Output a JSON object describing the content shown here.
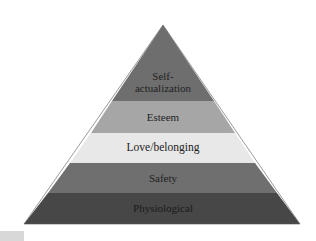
{
  "diagram": {
    "type": "pyramid",
    "title": "",
    "levels": [
      {
        "label_line1": "Self-",
        "label_line2": "actualization",
        "color": "#6e6e6e"
      },
      {
        "label": "Esteem",
        "color": "#a6a6a6"
      },
      {
        "label": "Love/belonging",
        "color": "#e8e8e8"
      },
      {
        "label": "Safety",
        "color": "#6f6f6f"
      },
      {
        "label": "Physiological",
        "color": "#474747"
      }
    ]
  }
}
